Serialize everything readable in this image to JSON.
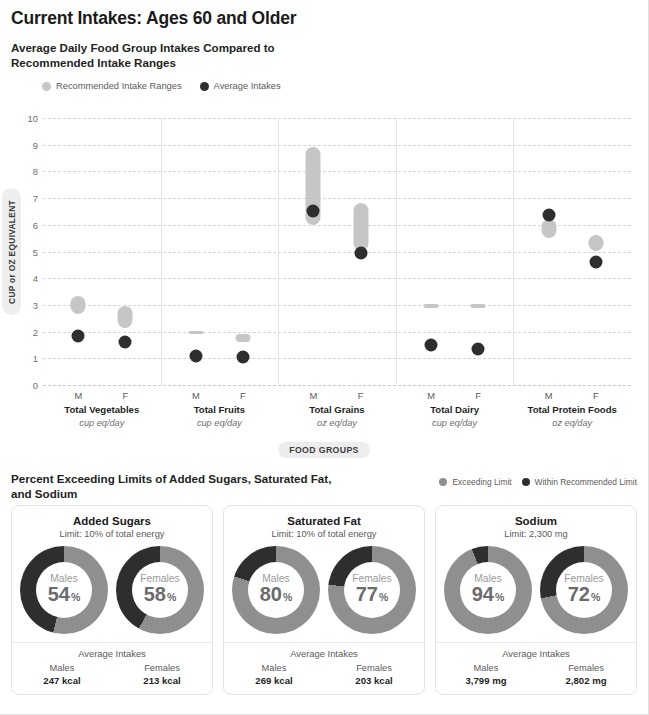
{
  "page_title": "Current Intakes: Ages 60 and Older",
  "section1": {
    "title": "Average Daily Food Group Intakes Compared to Recommended Intake Ranges",
    "legend": [
      {
        "label": "Recommended Intake Ranges",
        "color": "#c6c6c6"
      },
      {
        "label": "Average Intakes",
        "color": "#2e2e2e"
      }
    ],
    "y_axis_label": "CUP or OZ EQUIVALENT",
    "x_axis_label": "FOOD GROUPS"
  },
  "chart_data": {
    "type": "scatter",
    "title": "Average Daily Food Group Intakes Compared to Recommended Intake Ranges",
    "xlabel": "FOOD GROUPS",
    "ylabel": "CUP or OZ EQUIVALENT",
    "ylim": [
      0,
      10
    ],
    "yticks": [
      "0",
      "1",
      "2",
      "3",
      "4",
      "5",
      "6",
      "7",
      "8",
      "9",
      "10"
    ],
    "grid": true,
    "legend_position": "top-left",
    "series": [
      {
        "name": "Recommended Intake Ranges",
        "color": "#c6c6c6"
      },
      {
        "name": "Average Intakes",
        "color": "#2e2e2e"
      }
    ],
    "groups": [
      {
        "name": "Total Vegetables",
        "unit": "cup eq/day",
        "points": [
          {
            "sex": "M",
            "range_low": 2.65,
            "range_high": 3.35,
            "average": 1.85
          },
          {
            "sex": "F",
            "range_low": 2.15,
            "range_high": 2.95,
            "average": 1.6
          }
        ]
      },
      {
        "name": "Total Fruits",
        "unit": "cup eq/day",
        "points": [
          {
            "sex": "M",
            "range_low": 1.97,
            "range_high": 2.03,
            "average": 1.07
          },
          {
            "sex": "F",
            "range_low": 1.6,
            "range_high": 1.9,
            "average": 1.03
          }
        ]
      },
      {
        "name": "Total Grains",
        "unit": "oz eq/day",
        "points": [
          {
            "sex": "M",
            "range_low": 6.0,
            "range_high": 8.9,
            "average": 6.5
          },
          {
            "sex": "F",
            "range_low": 5.0,
            "range_high": 6.8,
            "average": 4.95
          }
        ]
      },
      {
        "name": "Total Dairy",
        "unit": "cup eq/day",
        "points": [
          {
            "sex": "M",
            "range_low": 2.97,
            "range_high": 3.03,
            "average": 1.5
          },
          {
            "sex": "F",
            "range_low": 2.97,
            "range_high": 3.03,
            "average": 1.35
          }
        ]
      },
      {
        "name": "Total Protein Foods",
        "unit": "oz eq/day",
        "points": [
          {
            "sex": "M",
            "range_low": 5.5,
            "range_high": 6.2,
            "average": 6.35
          },
          {
            "sex": "F",
            "range_low": 5.0,
            "range_high": 5.6,
            "average": 4.6
          }
        ]
      }
    ]
  },
  "section2": {
    "title": "Percent Exceeding Limits of Added Sugars, Saturated Fat, and Sodium",
    "legend": [
      {
        "label": "Exceeding Limit",
        "color": "#8f8f8f"
      },
      {
        "label": "Within Recommended Limit",
        "color": "#2e2e2e"
      }
    ],
    "avg_intakes_label": "Average Intakes",
    "cards": [
      {
        "title": "Added Sugars",
        "subtitle": "Limit: 10% of total energy",
        "donuts": [
          {
            "sex": "Males",
            "percent": 54,
            "percent_text": "54",
            "symbol": "%"
          },
          {
            "sex": "Females",
            "percent": 58,
            "percent_text": "58",
            "symbol": "%"
          }
        ],
        "averages": [
          {
            "sex": "Males",
            "value": "247 kcal"
          },
          {
            "sex": "Females",
            "value": "213 kcal"
          }
        ]
      },
      {
        "title": "Saturated Fat",
        "subtitle": "Limit: 10% of total energy",
        "donuts": [
          {
            "sex": "Males",
            "percent": 80,
            "percent_text": "80",
            "symbol": "%"
          },
          {
            "sex": "Females",
            "percent": 77,
            "percent_text": "77",
            "symbol": "%"
          }
        ],
        "averages": [
          {
            "sex": "Males",
            "value": "269 kcal"
          },
          {
            "sex": "Females",
            "value": "203 kcal"
          }
        ]
      },
      {
        "title": "Sodium",
        "subtitle": "Limit: 2,300 mg",
        "donuts": [
          {
            "sex": "Males",
            "percent": 94,
            "percent_text": "94",
            "symbol": "%"
          },
          {
            "sex": "Females",
            "percent": 72,
            "percent_text": "72",
            "symbol": "%"
          }
        ],
        "averages": [
          {
            "sex": "Males",
            "value": "3,799 mg"
          },
          {
            "sex": "Females",
            "value": "2,802 mg"
          }
        ]
      }
    ]
  }
}
